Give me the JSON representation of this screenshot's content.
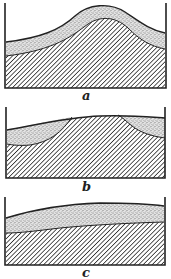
{
  "figure": {
    "colors": {
      "ink": "#222222",
      "background": "#ffffff",
      "stipple": "#9a9a9a"
    },
    "panels": [
      {
        "id": "a",
        "label": "a",
        "shape": "hill: a stippled layer of roughly uniform thickness draped over a hatched mound"
      },
      {
        "id": "b",
        "label": "b",
        "shape": "flattened: hatched base nearly reaches the surface; stippled material remains only as lenses at the left and right sides"
      },
      {
        "id": "c",
        "label": "c",
        "shape": "leveled: a thin continuous stippled layer over a nearly flat hatched base"
      }
    ]
  }
}
